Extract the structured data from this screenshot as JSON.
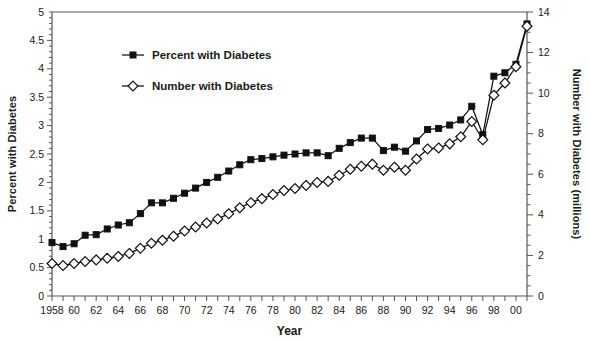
{
  "chart_data": {
    "type": "line",
    "title": "",
    "xlabel": "Year",
    "ylabel": "Percent with Diabetes",
    "y2label": "Number with Diabetes (millions)",
    "xlim": [
      1958,
      2001
    ],
    "ylim": [
      0,
      5
    ],
    "y2lim": [
      0,
      14
    ],
    "grid": false,
    "legend_position": "upper-left-inside",
    "x": [
      1958,
      1959,
      1960,
      1961,
      1962,
      1963,
      1964,
      1965,
      1966,
      1967,
      1968,
      1969,
      1970,
      1971,
      1972,
      1973,
      1974,
      1975,
      1976,
      1977,
      1978,
      1979,
      1980,
      1981,
      1982,
      1983,
      1984,
      1985,
      1986,
      1987,
      1988,
      1989,
      1990,
      1991,
      1992,
      1993,
      1994,
      1995,
      1996,
      1997,
      1998,
      1999,
      2000,
      2001
    ],
    "x_ticklabels": [
      "1958",
      "60",
      "62",
      "64",
      "66",
      "68",
      "70",
      "72",
      "74",
      "76",
      "78",
      "80",
      "82",
      "84",
      "86",
      "88",
      "90",
      "92",
      "94",
      "96",
      "98",
      "00"
    ],
    "x_ticklabel_years": [
      1958,
      1960,
      1962,
      1964,
      1966,
      1968,
      1970,
      1972,
      1974,
      1976,
      1978,
      1980,
      1982,
      1984,
      1986,
      1988,
      1990,
      1992,
      1994,
      1996,
      1998,
      2000
    ],
    "y_ticklabels": [
      "0",
      "0.5",
      "1",
      "1.5",
      "2",
      "2.5",
      "3",
      "3.5",
      "4",
      "4.5",
      "5"
    ],
    "y_tickvalues": [
      0,
      0.5,
      1,
      1.5,
      2,
      2.5,
      3,
      3.5,
      4,
      4.5,
      5
    ],
    "y2_ticklabels": [
      "0",
      "2",
      "4",
      "6",
      "8",
      "10",
      "12",
      "14"
    ],
    "y2_tickvalues": [
      0,
      2,
      4,
      6,
      8,
      10,
      12,
      14
    ],
    "series": [
      {
        "name": "Percent with Diabetes",
        "axis": "left",
        "marker": "filled-square",
        "color": "#111111",
        "values": [
          0.94,
          0.87,
          0.92,
          1.07,
          1.08,
          1.18,
          1.25,
          1.29,
          1.45,
          1.64,
          1.64,
          1.72,
          1.81,
          1.9,
          2.0,
          2.09,
          2.2,
          2.31,
          2.4,
          2.42,
          2.45,
          2.48,
          2.5,
          2.52,
          2.52,
          2.47,
          2.6,
          2.7,
          2.78,
          2.78,
          2.56,
          2.62,
          2.55,
          2.73,
          2.93,
          2.95,
          3.01,
          3.1,
          3.34,
          2.84,
          3.87,
          3.93,
          4.08,
          4.79
        ]
      },
      {
        "name": "Number with Diabetes",
        "axis": "right",
        "marker": "open-diamond",
        "color": "#111111",
        "values": [
          1.6,
          1.5,
          1.6,
          1.7,
          1.78,
          1.86,
          1.95,
          2.1,
          2.35,
          2.6,
          2.75,
          2.95,
          3.2,
          3.4,
          3.6,
          3.8,
          4.05,
          4.35,
          4.6,
          4.8,
          5.0,
          5.2,
          5.3,
          5.45,
          5.6,
          5.65,
          5.95,
          6.25,
          6.4,
          6.5,
          6.2,
          6.35,
          6.2,
          6.75,
          7.25,
          7.3,
          7.5,
          7.85,
          8.6,
          7.7,
          9.9,
          10.5,
          11.3,
          13.3
        ]
      }
    ]
  },
  "legend": {
    "entries": [
      {
        "label": "Percent with Diabetes",
        "marker": "filled-square"
      },
      {
        "label": "Number with Diabetes",
        "marker": "open-diamond"
      }
    ]
  },
  "axes": {
    "left_title": "Percent with Diabetes",
    "right_title": "Number with Diabetes (millions)",
    "bottom_title": "Year"
  },
  "colors": {
    "line": "#111111",
    "axis": "#555555",
    "text": "#1a1a1a",
    "background": "#ffffff"
  }
}
